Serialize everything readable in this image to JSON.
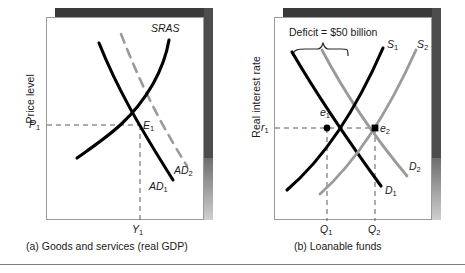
{
  "figure": {
    "panels": [
      {
        "id": "a",
        "caption": "(a) Goods and services (real GDP)",
        "y_axis_label": "Price level",
        "y_tick": "P",
        "y_tick_sub": "1",
        "x_tick": "Y",
        "x_tick_sub": "1",
        "equilibrium_label": "E",
        "equilibrium_sub": "1",
        "curves": [
          {
            "name": "SRAS",
            "sub": "",
            "color": "#000000",
            "style": "solid"
          },
          {
            "name": "AD",
            "sub": "1",
            "color": "#000000",
            "style": "solid"
          },
          {
            "name": "AD",
            "sub": "2",
            "color": "#9a9a9a",
            "style": "dashed"
          }
        ]
      },
      {
        "id": "b",
        "caption": "(b) Loanable funds",
        "y_axis_label": "Real interest rate",
        "y_tick": "r",
        "y_tick_sub": "1",
        "x_ticks": [
          {
            "name": "Q",
            "sub": "1"
          },
          {
            "name": "Q",
            "sub": "2"
          }
        ],
        "annotation": "Deficit = $50 billion",
        "equilibria": [
          {
            "name": "e",
            "sub": "1"
          },
          {
            "name": "e",
            "sub": "2"
          }
        ],
        "curves": [
          {
            "name": "S",
            "sub": "1",
            "color": "#000000",
            "style": "solid"
          },
          {
            "name": "S",
            "sub": "2",
            "color": "#9a9a9a",
            "style": "solid"
          },
          {
            "name": "D",
            "sub": "1",
            "color": "#000000",
            "style": "solid"
          },
          {
            "name": "D",
            "sub": "2",
            "color": "#9a9a9a",
            "style": "solid"
          }
        ]
      }
    ],
    "colors": {
      "primary_curve": "#000000",
      "secondary_curve": "#9a9a9a",
      "guide_line": "#6e6e6e",
      "frame": "#9a9a9a",
      "shadow": "#3a3a3a"
    }
  }
}
